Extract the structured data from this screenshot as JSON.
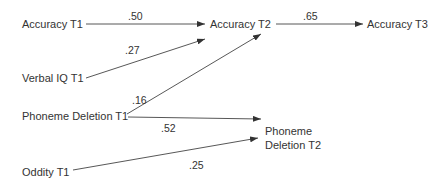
{
  "diagram": {
    "type": "path-diagram",
    "nodes": [
      {
        "id": "acc_t1",
        "label": "Accuracy T1"
      },
      {
        "id": "vocab_t1",
        "label": "Verbal IQ T1"
      },
      {
        "id": "pd_t1",
        "label": "Phoneme Deletion T1"
      },
      {
        "id": "odd_t1",
        "label": "Oddity T1"
      },
      {
        "id": "acc_t2",
        "label": "Accuracy T2"
      },
      {
        "id": "acc_t3",
        "label": "Accuracy T3"
      },
      {
        "id": "pd_t2",
        "label_line1": "Phoneme",
        "label_line2": "Deletion T2"
      }
    ],
    "edges": [
      {
        "from": "acc_t1",
        "to": "acc_t2",
        "coef": ".50"
      },
      {
        "from": "vocab_t1",
        "to": "acc_t2",
        "coef": ".27"
      },
      {
        "from": "pd_t1",
        "to": "acc_t2",
        "coef": ".16"
      },
      {
        "from": "acc_t2",
        "to": "acc_t3",
        "coef": ".65"
      },
      {
        "from": "pd_t1",
        "to": "pd_t2",
        "coef": ".52"
      },
      {
        "from": "odd_t1",
        "to": "pd_t2",
        "coef": ".25"
      }
    ],
    "colors": {
      "line": "#333333",
      "text": "#333333",
      "background": "#ffffff"
    }
  }
}
